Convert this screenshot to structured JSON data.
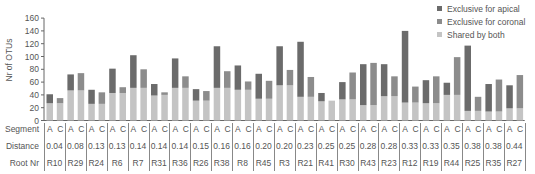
{
  "chart_data": {
    "type": "bar",
    "stacked": true,
    "title": "",
    "xlabel": "",
    "ylabel": "Nr of OTUs",
    "ylim": [
      0,
      160
    ],
    "yticks": [
      0,
      20,
      40,
      60,
      80,
      100,
      120,
      140,
      160
    ],
    "grid": false,
    "legend_position": "top-right",
    "legend": [
      "Exclusive for apical",
      "Exclusive for coronal",
      "Shared by both"
    ],
    "colors": {
      "apical": "#6b6b6b",
      "coronal": "#8c8c8c",
      "shared": "#c4c4c4"
    },
    "table_row_labels": [
      "Segment",
      "Distance",
      "Root Nr"
    ],
    "segments": [
      "A",
      "C"
    ],
    "roots": [
      {
        "root": "R10",
        "distance": "0.04",
        "A": {
          "shared": 27,
          "exclusive": 14
        },
        "C": {
          "shared": 27,
          "exclusive": 8
        }
      },
      {
        "root": "R29",
        "distance": "0.08",
        "A": {
          "shared": 47,
          "exclusive": 25
        },
        "C": {
          "shared": 47,
          "exclusive": 27
        }
      },
      {
        "root": "R24",
        "distance": "0.13",
        "A": {
          "shared": 26,
          "exclusive": 22
        },
        "C": {
          "shared": 26,
          "exclusive": 18
        }
      },
      {
        "root": "R6",
        "distance": "0.13",
        "A": {
          "shared": 43,
          "exclusive": 38
        },
        "C": {
          "shared": 43,
          "exclusive": 9
        }
      },
      {
        "root": "R7",
        "distance": "0.14",
        "A": {
          "shared": 51,
          "exclusive": 51
        },
        "C": {
          "shared": 51,
          "exclusive": 29
        }
      },
      {
        "root": "R31",
        "distance": "0.14",
        "A": {
          "shared": 39,
          "exclusive": 18
        },
        "C": {
          "shared": 40,
          "exclusive": 4
        }
      },
      {
        "root": "R36",
        "distance": "0.14",
        "A": {
          "shared": 51,
          "exclusive": 46
        },
        "C": {
          "shared": 51,
          "exclusive": 18
        }
      },
      {
        "root": "R26",
        "distance": "0.15",
        "A": {
          "shared": 31,
          "exclusive": 18
        },
        "C": {
          "shared": 31,
          "exclusive": 15
        }
      },
      {
        "root": "R38",
        "distance": "0.16",
        "A": {
          "shared": 51,
          "exclusive": 65
        },
        "C": {
          "shared": 51,
          "exclusive": 26
        }
      },
      {
        "root": "R8",
        "distance": "0.16",
        "A": {
          "shared": 48,
          "exclusive": 38
        },
        "C": {
          "shared": 48,
          "exclusive": 13
        }
      },
      {
        "root": "R45",
        "distance": "0.20",
        "A": {
          "shared": 34,
          "exclusive": 39
        },
        "C": {
          "shared": 34,
          "exclusive": 28
        }
      },
      {
        "root": "R3",
        "distance": "0.20",
        "A": {
          "shared": 55,
          "exclusive": 61
        },
        "C": {
          "shared": 55,
          "exclusive": 24
        }
      },
      {
        "root": "R21",
        "distance": "0.23",
        "A": {
          "shared": 37,
          "exclusive": 86
        },
        "C": {
          "shared": 37,
          "exclusive": 31
        }
      },
      {
        "root": "R41",
        "distance": "0.25",
        "A": {
          "shared": 30,
          "exclusive": 13
        },
        "C": {
          "shared": 31,
          "exclusive": 0
        }
      },
      {
        "root": "R30",
        "distance": "0.25",
        "A": {
          "shared": 33,
          "exclusive": 27
        },
        "C": {
          "shared": 33,
          "exclusive": 42
        }
      },
      {
        "root": "R43",
        "distance": "0.28",
        "A": {
          "shared": 24,
          "exclusive": 64
        },
        "C": {
          "shared": 24,
          "exclusive": 66
        }
      },
      {
        "root": "R23",
        "distance": "0.28",
        "A": {
          "shared": 38,
          "exclusive": 50
        },
        "C": {
          "shared": 38,
          "exclusive": 31
        }
      },
      {
        "root": "R12",
        "distance": "0.33",
        "A": {
          "shared": 28,
          "exclusive": 112
        },
        "C": {
          "shared": 28,
          "exclusive": 25
        }
      },
      {
        "root": "R19",
        "distance": "0.33",
        "A": {
          "shared": 27,
          "exclusive": 36
        },
        "C": {
          "shared": 27,
          "exclusive": 42
        }
      },
      {
        "root": "R44",
        "distance": "0.35",
        "A": {
          "shared": 40,
          "exclusive": 19
        },
        "C": {
          "shared": 40,
          "exclusive": 59
        }
      },
      {
        "root": "R25",
        "distance": "0.38",
        "A": {
          "shared": 15,
          "exclusive": 102
        },
        "C": {
          "shared": 15,
          "exclusive": 22
        }
      },
      {
        "root": "R35",
        "distance": "0.38",
        "A": {
          "shared": 14,
          "exclusive": 43
        },
        "C": {
          "shared": 14,
          "exclusive": 50
        }
      },
      {
        "root": "R27",
        "distance": "0.44",
        "A": {
          "shared": 19,
          "exclusive": 36
        },
        "C": {
          "shared": 19,
          "exclusive": 52
        }
      }
    ]
  }
}
